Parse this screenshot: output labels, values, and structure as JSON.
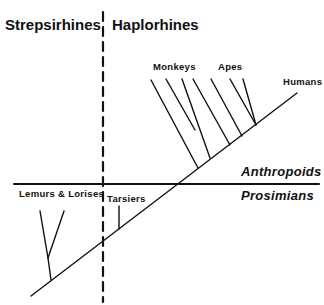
{
  "diagram": {
    "type": "phylogenetic-tree",
    "headers": {
      "left": "Strepsirhines",
      "right": "Haplorhines"
    },
    "divisions": {
      "upper": "Anthropoids",
      "lower": "Prosimians"
    },
    "taxa": {
      "lemurs": "Lemurs & Lorises",
      "tarsiers": "Tarsiers",
      "monkeys": "Monkeys",
      "apes": "Apes",
      "humans": "Humans"
    },
    "colors": {
      "line": "#111111",
      "background": "#ffffff"
    }
  }
}
